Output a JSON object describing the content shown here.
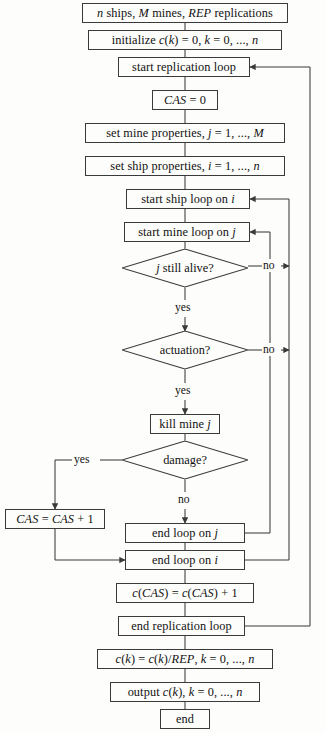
{
  "diagram": {
    "type": "flowchart",
    "colors": {
      "stroke": "#3a3a3a",
      "text": "#111111",
      "background": "#fdfdfb"
    },
    "nodes": [
      {
        "id": "inputs",
        "shape": "process",
        "label": "n ships, M mines, REP replications"
      },
      {
        "id": "initialize",
        "shape": "process",
        "label": "initialize c(k) = 0, k = 0, ..., n"
      },
      {
        "id": "start-rep",
        "shape": "process",
        "label": "start replication loop"
      },
      {
        "id": "cas-zero",
        "shape": "process",
        "label": "CAS = 0"
      },
      {
        "id": "set-mine",
        "shape": "process",
        "label": "set mine properties, j = 1, ..., M"
      },
      {
        "id": "set-ship",
        "shape": "process",
        "label": "set ship properties, i = 1, ..., n"
      },
      {
        "id": "start-ship",
        "shape": "process",
        "label": "start ship loop on i"
      },
      {
        "id": "start-mine",
        "shape": "process",
        "label": "start mine loop on j"
      },
      {
        "id": "still-alive",
        "shape": "decision",
        "label": "j still alive?"
      },
      {
        "id": "actuation",
        "shape": "decision",
        "label": "actuation?"
      },
      {
        "id": "kill-mine",
        "shape": "process",
        "label": "kill mine j"
      },
      {
        "id": "damage",
        "shape": "decision",
        "label": "damage?"
      },
      {
        "id": "cas-incr",
        "shape": "process",
        "label": "CAS = CAS + 1"
      },
      {
        "id": "end-loop-j",
        "shape": "process",
        "label": "end loop on j"
      },
      {
        "id": "end-loop-i",
        "shape": "process",
        "label": "end loop on i"
      },
      {
        "id": "count-cas",
        "shape": "process",
        "label": "c(CAS) = c(CAS) + 1"
      },
      {
        "id": "end-rep",
        "shape": "process",
        "label": "end replication loop"
      },
      {
        "id": "average",
        "shape": "process",
        "label": "c(k) = c(k)/REP, k = 0, ..., n"
      },
      {
        "id": "output",
        "shape": "process",
        "label": "output c(k), k = 0, ..., n"
      },
      {
        "id": "end",
        "shape": "terminator",
        "label": "end"
      }
    ],
    "edge_labels": {
      "alive_no": "no",
      "alive_yes": "yes",
      "actuation_no": "no",
      "actuation_yes": "yes",
      "damage_yes": "yes",
      "damage_no": "no"
    }
  }
}
